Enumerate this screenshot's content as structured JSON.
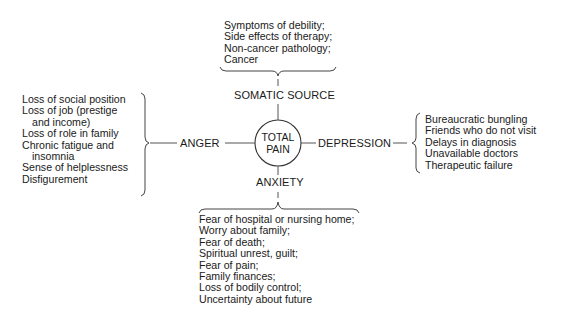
{
  "diagram": {
    "center": {
      "line1": "TOTAL",
      "line2": "PAIN"
    },
    "nodes": {
      "top": "SOMATIC SOURCE",
      "left": "ANGER",
      "right": "DEPRESSION",
      "bottom": "ANXIETY"
    },
    "somatic_items": [
      "Symptoms of debility;",
      "Side effects of therapy;",
      "Non-cancer pathology;",
      "Cancer"
    ],
    "anger_items": [
      {
        "text": "Loss of social position",
        "indent": false
      },
      {
        "text": "Loss of job (prestige",
        "indent": false
      },
      {
        "text": "and income)",
        "indent": true
      },
      {
        "text": "Loss of role in family",
        "indent": false
      },
      {
        "text": "Chronic fatigue and",
        "indent": false
      },
      {
        "text": "insomnia",
        "indent": true
      },
      {
        "text": "Sense of helplessness",
        "indent": false
      },
      {
        "text": "Disfigurement",
        "indent": false
      }
    ],
    "depression_items": [
      "Bureaucratic bungling",
      "Friends who do not visit",
      "Delays in diagnosis",
      "Unavailable doctors",
      "Therapeutic failure"
    ],
    "anxiety_items": [
      "Fear of hospital or nursing home;",
      "Worry about family;",
      "Fear of death;",
      "Spiritual unrest, guilt;",
      "Fear of pain;",
      "Family finances;",
      "Loss of bodily control;",
      "Uncertainty about future"
    ]
  }
}
